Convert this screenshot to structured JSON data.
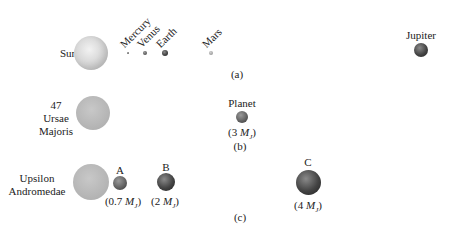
{
  "panel_a": {
    "caption": "(a)",
    "star": {
      "label": "Sun"
    },
    "planets": [
      {
        "label": "Mercury"
      },
      {
        "label": "Venus"
      },
      {
        "label": "Earth"
      },
      {
        "label": "Mars"
      },
      {
        "label": "Jupiter"
      }
    ]
  },
  "panel_b": {
    "caption": "(b)",
    "star": {
      "label_lines": [
        "47",
        "Ursae",
        "Majoris"
      ]
    },
    "planet": {
      "label": "Planet",
      "mass_value": "3",
      "mass_unit": "M",
      "mass_sub": "J"
    }
  },
  "panel_c": {
    "caption": "(c)",
    "star": {
      "label_lines": [
        "Upsilon",
        "Andromedae"
      ]
    },
    "planets": [
      {
        "label": "A",
        "mass_value": "0.7",
        "mass_unit": "M",
        "mass_sub": "J"
      },
      {
        "label": "B",
        "mass_value": "2",
        "mass_unit": "M",
        "mass_sub": "J"
      },
      {
        "label": "C",
        "mass_value": "4",
        "mass_unit": "M",
        "mass_sub": "J"
      }
    ]
  }
}
